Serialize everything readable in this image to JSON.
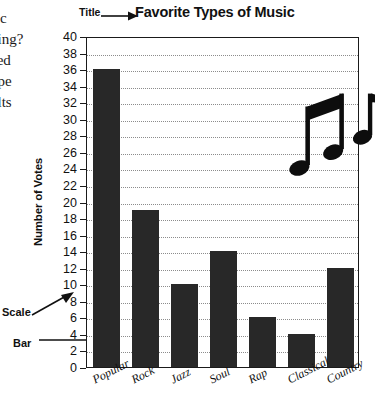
{
  "margin_text": {
    "lines": [
      "sic",
      "oing?",
      "ced",
      "ype",
      "ults"
    ]
  },
  "callouts": {
    "title_label": "Title",
    "scale_label": "Scale",
    "bar_label": "Bar"
  },
  "decoration": {
    "music_note_icon": "eighth-note-pair",
    "single_note_icon": "eighth-note"
  },
  "chart_data": {
    "type": "bar",
    "title": "Favorite Types of Music",
    "xlabel": "",
    "ylabel": "Number of Votes",
    "categories": [
      "Popular",
      "Rock",
      "Jazz",
      "Soul",
      "Rap",
      "Classical",
      "Country"
    ],
    "values": [
      36,
      19,
      10,
      14,
      6,
      4,
      12
    ],
    "ylim": [
      0,
      40
    ],
    "ytick_step": 2,
    "yticks": [
      0,
      2,
      4,
      6,
      8,
      10,
      12,
      14,
      16,
      18,
      20,
      22,
      24,
      26,
      28,
      30,
      32,
      34,
      36,
      38,
      40
    ],
    "grid": true,
    "grid_style": "dotted-horizontal",
    "legend": null,
    "bar_color": "#282828"
  }
}
